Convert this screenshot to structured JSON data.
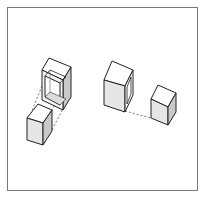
{
  "figure": {
    "colors": {
      "frame": "#7a7a7a",
      "edge": "#222222",
      "top_face": "#ffffff",
      "front_face": "#e6e6e6",
      "side_face": "#c9c9c9",
      "dashed": "#555555"
    },
    "groups": [
      {
        "name": "left-group",
        "cubes": [
          "hollow-front cube (upper)",
          "solid cube (lower)"
        ],
        "connector": "dashed lines"
      },
      {
        "name": "right-group",
        "cubes": [
          "hollow-side cube (large)",
          "solid cube (small)"
        ],
        "connector": "dashed line"
      }
    ]
  }
}
